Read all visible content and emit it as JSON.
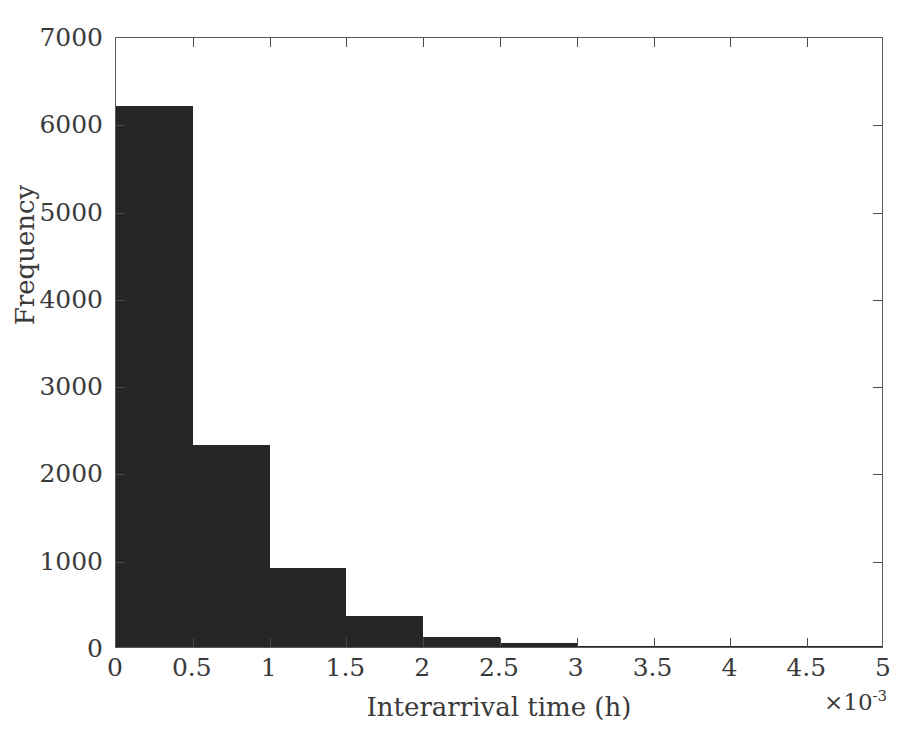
{
  "chart_data": {
    "type": "bar",
    "title": "",
    "subtitle": "",
    "xlabel": "Interarrival time (h)",
    "ylabel": "Frequency",
    "x_exponent_label": "×10⁻³",
    "x_exponent_base": "×10",
    "x_exponent_power": "-3",
    "xlim": [
      0,
      5
    ],
    "ylim": [
      0,
      7000
    ],
    "xticks": [
      0,
      0.5,
      1,
      1.5,
      2,
      2.5,
      3,
      3.5,
      4,
      4.5,
      5
    ],
    "xticklabels": [
      "0",
      "0.5",
      "1",
      "1.5",
      "2",
      "2.5",
      "3",
      "3.5",
      "4",
      "4.5",
      "5"
    ],
    "yticks": [
      0,
      1000,
      2000,
      3000,
      4000,
      5000,
      6000,
      7000
    ],
    "yticklabels": [
      "0",
      "1000",
      "2000",
      "3000",
      "4000",
      "5000",
      "6000",
      "7000"
    ],
    "grid": false,
    "legend": null,
    "bar_color": "#262626",
    "axis_color": "#5a5a5a",
    "background_color": "#ffffff",
    "bin_edges": [
      0,
      0.5,
      1,
      1.5,
      2,
      2.5,
      3,
      3.5,
      4,
      4.5,
      5
    ],
    "bin_width": 0.5,
    "categories": [
      "0-0.5",
      "0.5-1",
      "1-1.5",
      "1.5-2",
      "2-2.5",
      "2.5-3",
      "3-3.5",
      "3.5-4",
      "4-4.5",
      "4.5-5"
    ],
    "values": [
      6200,
      2310,
      900,
      350,
      115,
      45,
      15,
      6,
      3,
      1
    ]
  },
  "figure": {
    "plot_left_px": 115,
    "plot_top_px": 37,
    "plot_width_px": 768,
    "plot_height_px": 611
  }
}
